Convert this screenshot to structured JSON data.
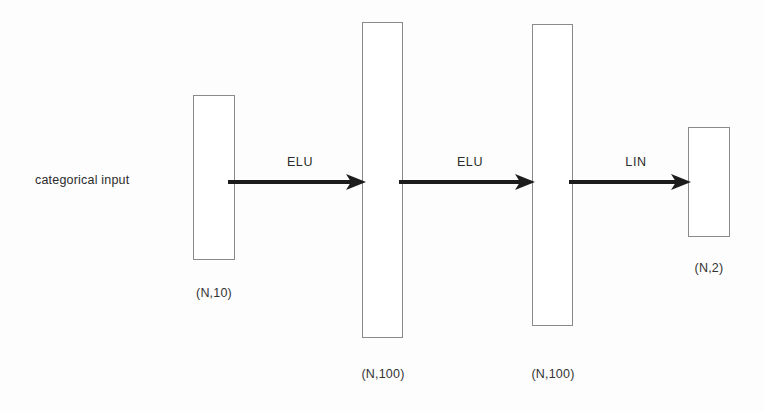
{
  "diagram": {
    "background_color": "#fdfdfd",
    "box_border_color": "#8a8a8a",
    "arrow_color": "#1c1c1c",
    "text_color": "#2b2b2b",
    "input_annotation": "categorical input",
    "layers": [
      {
        "id": "input-layer",
        "shape_label": "(N,10)",
        "units": 10,
        "x": 193,
        "y": 95,
        "width": 42,
        "height": 165,
        "label_x": 214,
        "label_y": 286
      },
      {
        "id": "hidden-layer-1",
        "shape_label": "(N,100)",
        "units": 100,
        "x": 362,
        "y": 22,
        "width": 41,
        "height": 316,
        "label_x": 383,
        "label_y": 367
      },
      {
        "id": "hidden-layer-2",
        "shape_label": "(N,100)",
        "units": 100,
        "x": 532,
        "y": 24,
        "width": 41,
        "height": 302,
        "label_x": 553,
        "label_y": 367
      },
      {
        "id": "output-layer",
        "shape_label": "(N,2)",
        "units": 2,
        "x": 688,
        "y": 127,
        "width": 42,
        "height": 110,
        "label_x": 709,
        "label_y": 261
      }
    ],
    "connections": [
      {
        "id": "edge-input-to-hidden1",
        "activation": "ELU",
        "from": "input-layer",
        "to": "hidden-layer-1",
        "x1": 230,
        "x2": 366,
        "y": 181,
        "label_x": 300,
        "label_y": 155
      },
      {
        "id": "edge-hidden1-to-hidden2",
        "activation": "ELU",
        "from": "hidden-layer-1",
        "to": "hidden-layer-2",
        "x1": 400,
        "x2": 536,
        "y": 181,
        "label_x": 470,
        "label_y": 155
      },
      {
        "id": "edge-hidden2-to-output",
        "activation": "LIN",
        "from": "hidden-layer-2",
        "to": "output-layer",
        "x1": 570,
        "x2": 692,
        "y": 181,
        "label_x": 636,
        "label_y": 155
      }
    ]
  }
}
